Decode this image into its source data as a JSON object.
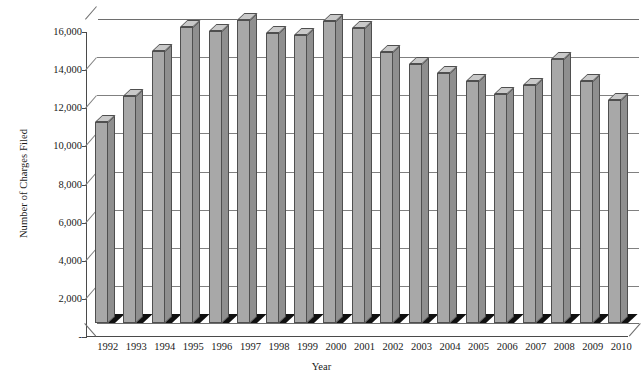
{
  "chart_data": {
    "type": "bar",
    "title": "",
    "subtitle": "",
    "xlabel": "Year",
    "ylabel": "Number of Charges Filed",
    "categories": [
      "1992",
      "1993",
      "1994",
      "1995",
      "1996",
      "1997",
      "1998",
      "1999",
      "2000",
      "2001",
      "2002",
      "2003",
      "2004",
      "2005",
      "2006",
      "2007",
      "2008",
      "2009",
      "2010"
    ],
    "values": [
      10532,
      11908,
      14295,
      15549,
      15342,
      15889,
      15191,
      15130,
      15836,
      15478,
      14202,
      13566,
      13136,
      12679,
      12025,
      12510,
      13867,
      12696,
      11717
    ],
    "series": [
      {
        "name": "Number of Charges Filed",
        "values": [
          10532,
          11908,
          14295,
          15549,
          15342,
          15889,
          15191,
          15130,
          15836,
          15478,
          14202,
          13566,
          13136,
          12679,
          12025,
          12510,
          13867,
          12696,
          11717
        ]
      }
    ],
    "ylim": [
      0,
      16000
    ],
    "ytick_values": [
      0,
      2000,
      4000,
      6000,
      8000,
      10000,
      12000,
      14000,
      16000
    ],
    "ytick_labels": [
      "-",
      "2,000",
      "4,000",
      "6,000",
      "8,000",
      "10,000",
      "12,000",
      "14,000",
      "16,000"
    ],
    "grid": true,
    "legend": false,
    "legend_position": "none",
    "style": "3d-column",
    "bar_color": "#a8a8a8",
    "bar_top_color": "#c9c9c9",
    "bar_side_color": "#8f8f8f",
    "bar_border_color": "#4f4f4f",
    "gridline_color": "#808080",
    "axis_color": "#4a4a4a",
    "background_color": "#ffffff"
  }
}
